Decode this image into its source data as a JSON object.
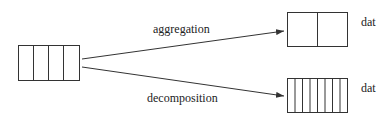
{
  "diagram": {
    "source_block": {
      "cells": 4
    },
    "arrows": [
      {
        "label": "aggregation"
      },
      {
        "label": "decomposition"
      }
    ],
    "targets": [
      {
        "cells": 2,
        "label": "dat"
      },
      {
        "cells": 8,
        "label": "dat"
      }
    ],
    "colors": {
      "stroke": "#333333",
      "text": "#222222"
    }
  }
}
